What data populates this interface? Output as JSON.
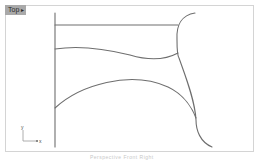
{
  "viewport": {
    "tab_label": "Top",
    "tab_menu_icon": "dropdown-arrow-icon",
    "axis_icon": {
      "y_label": "y",
      "x_label": "x"
    }
  },
  "status": {
    "text": "Perspective   Front   Right"
  },
  "colors": {
    "curve": "#6e6e6e",
    "frame": "#d4d4d4",
    "tab_bg": "#a9a9a9"
  }
}
